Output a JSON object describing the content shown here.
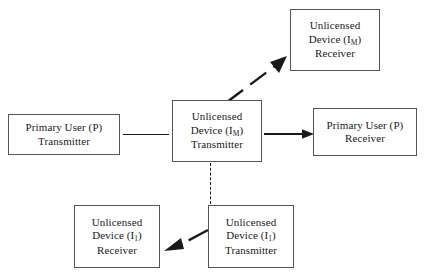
{
  "diagram": {
    "background_color": "#ffffff",
    "line_color": "#1a1a1a",
    "box_border_color": "#555555",
    "text_color": "#1a1a1a",
    "nodes": [
      {
        "id": "primary-user-transmitter",
        "lines": [
          "Primary User (P)",
          "Transmitter"
        ],
        "label_l1": "Primary User (P)",
        "label_l2": "Transmitter"
      },
      {
        "id": "unlicensed-device-m-transmitter",
        "label_l1": "Unlicensed",
        "label_l2_pre": "Device (I",
        "label_l2_sub": "M",
        "label_l2_post": ")",
        "label_l3": "Transmitter"
      },
      {
        "id": "primary-user-receiver",
        "label_l1": "Primary User (P)",
        "label_l2": "Receiver"
      },
      {
        "id": "unlicensed-device-m-receiver",
        "label_l1": "Unlicensed",
        "label_l2_pre": "Device (I",
        "label_l2_sub": "M",
        "label_l2_post": ")",
        "label_l3": "Receiver"
      },
      {
        "id": "unlicensed-device-1-transmitter",
        "label_l1": "Unlicensed",
        "label_l2_pre": "Device (I",
        "label_l2_sub": "1",
        "label_l2_post": ")",
        "label_l3": "Transmitter"
      },
      {
        "id": "unlicensed-device-1-receiver",
        "label_l1": "Unlicensed",
        "label_l2_pre": "Device (I",
        "label_l2_sub": "1",
        "label_l2_post": ")",
        "label_l3": "Receiver"
      }
    ],
    "edges": [
      {
        "id": "pu-tx-to-ud-m-tx",
        "from": "primary-user-transmitter",
        "to": "unlicensed-device-m-transmitter",
        "style": "solid",
        "arrowhead": "none"
      },
      {
        "id": "ud-m-tx-to-pu-rx",
        "from": "unlicensed-device-m-transmitter",
        "to": "primary-user-receiver",
        "style": "solid",
        "arrowhead": "filled-right"
      },
      {
        "id": "ud-m-tx-to-ud-m-rx",
        "from": "unlicensed-device-m-transmitter",
        "to": "unlicensed-device-m-receiver",
        "style": "dashed",
        "arrowhead": "filled-up-right"
      },
      {
        "id": "ud-m-tx-to-ud-1-tx",
        "from": "unlicensed-device-m-transmitter",
        "to": "unlicensed-device-1-transmitter",
        "style": "dashed",
        "arrowhead": "none"
      },
      {
        "id": "ud-1-tx-to-ud-1-rx",
        "from": "unlicensed-device-1-transmitter",
        "to": "unlicensed-device-1-receiver",
        "style": "dashed",
        "arrowhead": "filled-left"
      }
    ]
  }
}
